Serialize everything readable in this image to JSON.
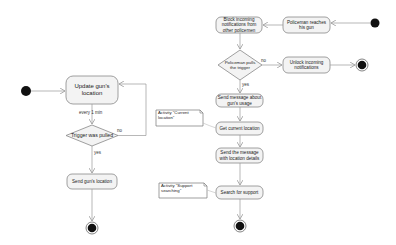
{
  "colors": {
    "action_fill": "#f3f3f3",
    "action_stroke": "#888888",
    "edge": "#999999",
    "node_black": "#111111",
    "note_fill": "#ffffff",
    "note_stroke": "#777777"
  },
  "left_flow": {
    "start": "initial-node",
    "update_location": "Update gun's location",
    "interval_label": "every 1 min",
    "decision": "Trigger was pulled",
    "no_label": "no",
    "yes_label": "yes",
    "send_location": "Send gun's location",
    "end": "final-node"
  },
  "right_flow": {
    "start": "initial-node",
    "reaches_gun": "Policeman reaches his gun",
    "block_notifications": "Block incoming notifications from other policemen",
    "decision": "Policeman pulls the trigger",
    "no_label": "no",
    "yes_label": "yes",
    "unlock_notifications": "Unlock incoming notifications",
    "send_usage_message": "Send message about gun's usage",
    "get_location": "Get current location",
    "send_location_details": "Send the message with location details",
    "search_support": "Search for support",
    "end": "final-node"
  },
  "notes": {
    "current_location": "Activity \"Current location\"",
    "support_searching": "Activity \"Support searching\""
  }
}
